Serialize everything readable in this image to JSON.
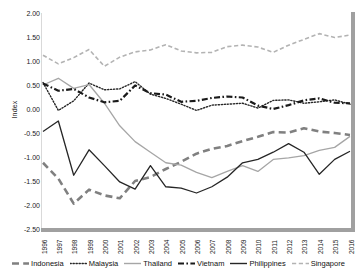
{
  "chart_data": {
    "type": "line",
    "title": "",
    "xlabel": "",
    "ylabel": "Index",
    "ylim": [
      -2.5,
      2.0
    ],
    "ytick_step": 0.5,
    "yticks": [
      "2.00",
      "1.50",
      "1.00",
      "0.50",
      "0.00",
      "-0.50",
      "-1.00",
      "-1.50",
      "-2.00",
      "-2.50"
    ],
    "ytick_values": [
      2.0,
      1.5,
      1.0,
      0.5,
      0.0,
      -0.5,
      -1.0,
      -1.5,
      -2.0,
      -2.5
    ],
    "grid": false,
    "legend_position": "bottom",
    "categories": [
      "1996",
      "1997",
      "1998",
      "1999",
      "2000",
      "2001",
      "2002",
      "2003",
      "2004",
      "2005",
      "2006",
      "2007",
      "2008",
      "2009",
      "2010",
      "2011",
      "2012",
      "2013",
      "2014",
      "2015",
      "2016"
    ],
    "x": [
      1996,
      1997,
      1998,
      1999,
      2000,
      2001,
      2002,
      2003,
      2004,
      2005,
      2006,
      2007,
      2008,
      2009,
      2010,
      2011,
      2012,
      2013,
      2014,
      2015,
      2016
    ],
    "series": [
      {
        "name": "Indonesia",
        "color": "#808080",
        "style": "long-dash",
        "width": 2.6,
        "values": [
          -1.12,
          -1.45,
          -1.97,
          -1.68,
          -1.8,
          -1.86,
          -1.5,
          -1.42,
          -1.25,
          -1.1,
          -0.93,
          -0.83,
          -0.77,
          -0.67,
          -0.58,
          -0.48,
          -0.49,
          -0.4,
          -0.47,
          -0.5,
          -0.54
        ]
      },
      {
        "name": "Malaysia",
        "color": "#262626",
        "style": "dotted",
        "width": 1.4,
        "values": [
          0.55,
          -0.03,
          0.17,
          0.54,
          0.4,
          0.42,
          0.57,
          0.31,
          0.22,
          0.1,
          -0.03,
          0.08,
          0.1,
          0.12,
          0.02,
          0.18,
          0.19,
          0.12,
          0.15,
          0.19,
          0.1
        ]
      },
      {
        "name": "Thailand",
        "color": "#a6a6a6",
        "style": "solid",
        "width": 1.3,
        "values": [
          0.5,
          0.64,
          0.43,
          0.51,
          0.12,
          -0.35,
          -0.68,
          -0.9,
          -1.12,
          -1.17,
          -1.32,
          -1.43,
          -1.3,
          -1.18,
          -1.3,
          -1.05,
          -1.02,
          -0.97,
          -0.86,
          -0.8,
          -0.57
        ]
      },
      {
        "name": "Vietnam",
        "color": "#1a1a1a",
        "style": "dash-dot",
        "width": 2.2,
        "values": [
          0.53,
          0.38,
          0.42,
          0.24,
          0.14,
          0.17,
          0.49,
          0.33,
          0.3,
          0.15,
          0.17,
          0.23,
          0.26,
          0.24,
          0.07,
          0.0,
          0.08,
          0.18,
          0.22,
          0.13,
          0.12
        ]
      },
      {
        "name": "Philippines",
        "color": "#262626",
        "style": "solid",
        "width": 1.3,
        "values": [
          -0.47,
          -0.25,
          -1.38,
          -0.85,
          -1.18,
          -1.52,
          -1.67,
          -1.18,
          -1.62,
          -1.65,
          -1.75,
          -1.62,
          -1.42,
          -1.12,
          -1.05,
          -0.9,
          -0.72,
          -0.9,
          -1.36,
          -1.05,
          -0.88
        ]
      },
      {
        "name": "Singapore",
        "color": "#b3b3b3",
        "style": "dash",
        "width": 1.6,
        "values": [
          1.12,
          0.94,
          1.07,
          1.24,
          0.89,
          1.08,
          1.19,
          1.23,
          1.34,
          1.21,
          1.17,
          1.18,
          1.3,
          1.33,
          1.29,
          1.18,
          1.33,
          1.45,
          1.57,
          1.49,
          1.54
        ]
      }
    ]
  },
  "axes": {
    "y_axis_label": "Index",
    "bottom_axis_color": "#a0a0a0",
    "right_axis_color": "#a0a0a0"
  },
  "legend": {
    "items": [
      {
        "label": "Indonesia"
      },
      {
        "label": "Malaysia"
      },
      {
        "label": "Thailand"
      },
      {
        "label": "Vietnam"
      },
      {
        "label": "Philippines"
      },
      {
        "label": "Singapore"
      }
    ]
  }
}
